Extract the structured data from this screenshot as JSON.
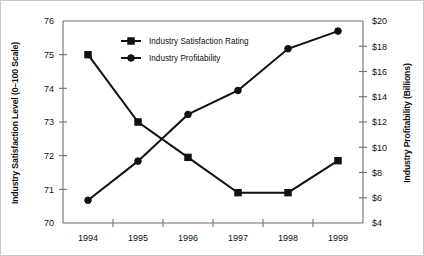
{
  "chart_data": {
    "type": "line",
    "title": "",
    "subtitle": "",
    "xlabel": "",
    "categories": [
      "1994",
      "1995",
      "1996",
      "1997",
      "1998",
      "1999"
    ],
    "grid": false,
    "legend_position": "inside-upper-left",
    "axes": {
      "left": {
        "label": "Industry Satisfaction Level (0–100 Scale)",
        "ticks": [
          "70",
          "71",
          "72",
          "73",
          "74",
          "75",
          "76"
        ],
        "tick_values": [
          70,
          71,
          72,
          73,
          74,
          75,
          76
        ],
        "ylim": [
          70,
          76
        ]
      },
      "right": {
        "label": "Industry Profitability (Billions)",
        "ticks": [
          "$4",
          "$6",
          "$8",
          "$10",
          "$12",
          "$14",
          "$16",
          "$18",
          "$20"
        ],
        "tick_values": [
          4,
          6,
          8,
          10,
          12,
          14,
          16,
          18,
          20
        ],
        "ylim": [
          4,
          20
        ]
      }
    },
    "series": [
      {
        "name": "Industry Satisfaction Rating",
        "axis": "left",
        "marker": "square",
        "color": "#111111",
        "values": [
          75.0,
          73.0,
          71.95,
          70.9,
          70.9,
          71.85
        ]
      },
      {
        "name": "Industry Profitability",
        "axis": "right",
        "marker": "circle",
        "color": "#111111",
        "values": [
          5.8,
          8.9,
          12.6,
          14.5,
          17.8,
          19.2
        ]
      }
    ],
    "legend": [
      {
        "label": "Industry Satisfaction Rating",
        "marker": "square"
      },
      {
        "label": "Industry Profitability",
        "marker": "circle"
      }
    ]
  }
}
